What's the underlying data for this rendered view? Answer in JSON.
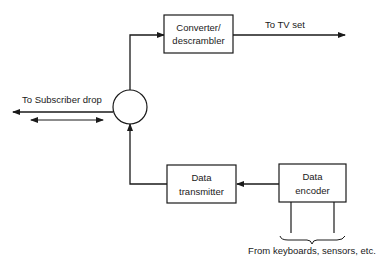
{
  "diagram": {
    "type": "block-diagram",
    "colors": {
      "stroke": "#1a1a1a",
      "background": "#ffffff"
    },
    "blocks": {
      "converter": {
        "line1": "Converter/",
        "line2": "descrambler"
      },
      "transmitter": {
        "line1": "Data",
        "line2": "transmitter"
      },
      "encoder": {
        "line1": "Data",
        "line2": "encoder"
      }
    },
    "splitter": {
      "shape": "circle"
    },
    "labels": {
      "tv_set": "To TV set",
      "subscriber_drop": "To Subscriber drop",
      "inputs": "From keyboards, sensors, etc."
    },
    "connections": [
      {
        "from": "splitter",
        "to": "converter"
      },
      {
        "from": "converter",
        "to": "tv_set"
      },
      {
        "from": "encoder",
        "to": "transmitter"
      },
      {
        "from": "transmitter",
        "to": "splitter"
      },
      {
        "from": "splitter",
        "to": "subscriber_drop",
        "bidirectional": true
      },
      {
        "from": "inputs",
        "to": "encoder"
      }
    ]
  }
}
